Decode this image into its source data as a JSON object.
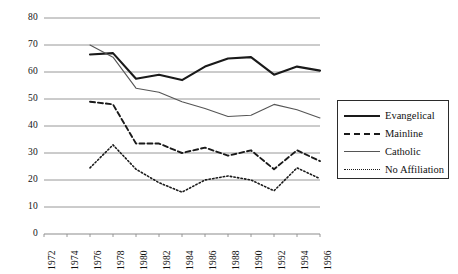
{
  "chart_data": {
    "type": "line",
    "title": "",
    "xlabel": "",
    "ylabel": "",
    "x": [
      1972,
      1974,
      1976,
      1978,
      1980,
      1982,
      1984,
      1986,
      1988,
      1990,
      1992,
      1994,
      1996
    ],
    "xlim": [
      1972,
      1996
    ],
    "ylim": [
      0,
      80
    ],
    "yticks": [
      0,
      10,
      20,
      30,
      40,
      50,
      60,
      70,
      80
    ],
    "xticks": [
      "1972",
      "1974",
      "1976",
      "1978",
      "1980",
      "1982",
      "1984",
      "1986",
      "1988",
      "1990",
      "1992",
      "1994",
      "1996"
    ],
    "grid": true,
    "legend_position": "right",
    "series": [
      {
        "name": "Evangelical",
        "style": "solid-bold",
        "color": "#1a1a1a",
        "x": [
          1976,
          1978,
          1980,
          1982,
          1984,
          1986,
          1988,
          1990,
          1992,
          1994,
          1996
        ],
        "values": [
          66.5,
          67,
          57.5,
          59,
          57,
          62,
          65,
          65.5,
          59,
          62,
          60.5
        ]
      },
      {
        "name": "Mainline",
        "style": "dashed",
        "color": "#1a1a1a",
        "x": [
          1976,
          1978,
          1980,
          1982,
          1984,
          1986,
          1988,
          1990,
          1992,
          1994,
          1996
        ],
        "values": [
          49,
          48,
          33.5,
          33.5,
          30,
          32,
          29,
          31,
          24,
          31,
          27
        ]
      },
      {
        "name": "Catholic",
        "style": "solid-thin",
        "color": "#555555",
        "x": [
          1976,
          1978,
          1980,
          1982,
          1984,
          1986,
          1988,
          1990,
          1992,
          1994,
          1996
        ],
        "values": [
          70,
          65.5,
          54,
          52.5,
          49,
          46.5,
          43.5,
          44,
          48,
          46,
          43
        ]
      },
      {
        "name": "No Affiliation",
        "style": "dotted",
        "color": "#1a1a1a",
        "x": [
          1976,
          1978,
          1980,
          1982,
          1984,
          1986,
          1988,
          1990,
          1992,
          1994,
          1996
        ],
        "values": [
          24.5,
          33,
          24,
          19,
          15.5,
          20,
          21.5,
          20,
          16,
          24.5,
          20.5
        ]
      }
    ]
  },
  "legend": {
    "items": [
      {
        "label": "Evangelical",
        "style": "solid-bold"
      },
      {
        "label": "Mainline",
        "style": "dashed"
      },
      {
        "label": "Catholic",
        "style": "solid-thin"
      },
      {
        "label": "No Affiliation",
        "style": "dotted"
      }
    ]
  },
  "axes": {
    "plot": {
      "left": 44,
      "right": 320,
      "top": 18,
      "bottom": 234
    },
    "grid_color": "#8c8c8c",
    "axis_color": "#8c8c8c"
  }
}
